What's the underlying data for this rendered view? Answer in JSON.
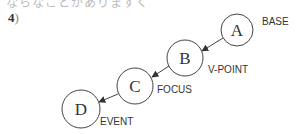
{
  "header": {
    "cut_text": "ならなことがありますく",
    "item_number": "4",
    "item_paren": ")"
  },
  "diagram": {
    "nodes": [
      {
        "id": "A",
        "letter": "A",
        "label": "BASE",
        "cx": 237,
        "cy": 30,
        "r": 16
      },
      {
        "id": "B",
        "letter": "B",
        "label": "V-POINT",
        "cx": 185,
        "cy": 58,
        "r": 18
      },
      {
        "id": "C",
        "letter": "C",
        "label": "FOCUS",
        "cx": 135,
        "cy": 86,
        "r": 18
      },
      {
        "id": "D",
        "letter": "D",
        "label": "EVENT",
        "cx": 81,
        "cy": 109,
        "r": 19
      }
    ],
    "edges": [
      {
        "from": "A",
        "to": "B"
      },
      {
        "from": "B",
        "to": "C"
      },
      {
        "from": "C",
        "to": "D"
      }
    ],
    "colors": {
      "stroke": "#444444",
      "text": "#333333"
    }
  }
}
